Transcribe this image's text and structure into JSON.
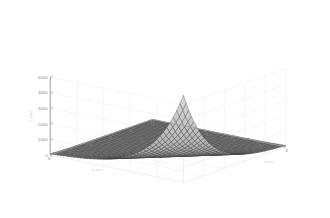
{
  "figure": {
    "background_color": "#ffffff",
    "plot_type_name": "matlab-3d-mesh-surface"
  },
  "chart_data": {
    "type": "surface",
    "title": "",
    "xlabel": "x-axis",
    "ylabel": "y-axis",
    "zlabel": "z-axis",
    "xlim": [
      1,
      6
    ],
    "ylim": [
      1,
      6
    ],
    "zlim": [
      0,
      5000
    ],
    "xticks": [
      1,
      2,
      3,
      4,
      5,
      6
    ],
    "yticks": [
      1,
      2,
      3,
      4,
      5,
      6
    ],
    "zticks": [
      0,
      1000,
      2000,
      3000,
      4000,
      5000
    ],
    "xticklabels": [
      "1",
      "2",
      "3",
      "4",
      "5",
      "6"
    ],
    "yticklabels": [
      "1",
      "2",
      "3",
      "4",
      "5",
      "6"
    ],
    "zticklabels": [
      "0",
      "1000",
      "2000",
      "3000",
      "4000",
      "5000"
    ],
    "grid": true,
    "legend": null,
    "colormap": "grayscale",
    "mesh_color": "#3a3a3a",
    "face_color": "#9a9a9a",
    "grid_color": "#e8e8e8",
    "axis_color": "#b0b0b0",
    "view_azimuth": -37.5,
    "view_elevation": 30,
    "mesh_n": 41,
    "corner_values": {
      "x1_y1": 0,
      "x6_y1": 300,
      "x1_y6": 300,
      "x6_y6": 5600
    },
    "samples": [
      {
        "x": 1,
        "y": 1,
        "z": 1
      },
      {
        "x": 2,
        "y": 1,
        "z": 4
      },
      {
        "x": 3,
        "y": 1,
        "z": 11
      },
      {
        "x": 4,
        "y": 1,
        "z": 30
      },
      {
        "x": 5,
        "y": 1,
        "z": 81
      },
      {
        "x": 6,
        "y": 1,
        "z": 221
      },
      {
        "x": 1,
        "y": 2,
        "z": 4
      },
      {
        "x": 2,
        "y": 2,
        "z": 16
      },
      {
        "x": 3,
        "y": 2,
        "z": 44
      },
      {
        "x": 4,
        "y": 2,
        "z": 120
      },
      {
        "x": 5,
        "y": 2,
        "z": 326
      },
      {
        "x": 6,
        "y": 2,
        "z": 886
      },
      {
        "x": 1,
        "y": 3,
        "z": 11
      },
      {
        "x": 2,
        "y": 3,
        "z": 44
      },
      {
        "x": 3,
        "y": 3,
        "z": 121
      },
      {
        "x": 4,
        "y": 3,
        "z": 330
      },
      {
        "x": 5,
        "y": 3,
        "z": 897
      },
      {
        "x": 6,
        "y": 3,
        "z": 1500
      },
      {
        "x": 1,
        "y": 4,
        "z": 30
      },
      {
        "x": 2,
        "y": 4,
        "z": 120
      },
      {
        "x": 3,
        "y": 4,
        "z": 330
      },
      {
        "x": 4,
        "y": 4,
        "z": 900
      },
      {
        "x": 5,
        "y": 4,
        "z": 2100
      },
      {
        "x": 6,
        "y": 4,
        "z": 3200
      },
      {
        "x": 1,
        "y": 5,
        "z": 81
      },
      {
        "x": 2,
        "y": 5,
        "z": 326
      },
      {
        "x": 3,
        "y": 5,
        "z": 897
      },
      {
        "x": 4,
        "y": 5,
        "z": 2100
      },
      {
        "x": 5,
        "y": 5,
        "z": 3800
      },
      {
        "x": 6,
        "y": 5,
        "z": 4800
      },
      {
        "x": 1,
        "y": 6,
        "z": 221
      },
      {
        "x": 2,
        "y": 6,
        "z": 886
      },
      {
        "x": 3,
        "y": 6,
        "z": 1500
      },
      {
        "x": 4,
        "y": 6,
        "z": 3200
      },
      {
        "x": 5,
        "y": 6,
        "z": 4800
      },
      {
        "x": 6,
        "y": 6,
        "z": 5600
      }
    ]
  }
}
